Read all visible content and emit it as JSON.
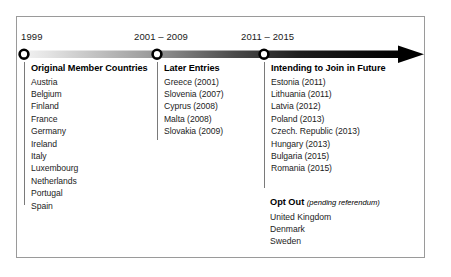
{
  "figure": {
    "kind": "horizontal-timeline",
    "colors": {
      "axis_start": "#e9e9e9",
      "axis_end": "#000000",
      "frame_border": "#9a9a9a",
      "divider": "#7a7a7a",
      "text": "#1c1c1c"
    }
  },
  "timeline": {
    "markers": [
      {
        "label": "1999",
        "x": 24
      },
      {
        "label": "2001 – 2009",
        "x": 157
      },
      {
        "label": "2011 – 2015",
        "x": 264
      }
    ],
    "arrow_label": "arrow-head-right"
  },
  "columns": [
    {
      "heading": "Original Member Countries",
      "entries": [
        "Austria",
        "Belgium",
        "Finland",
        "France",
        "Germany",
        "Ireland",
        "Italy",
        "Luxembourg",
        "Netherlands",
        "Portugal",
        "Spain"
      ]
    },
    {
      "heading": "Later Entries",
      "entries": [
        "Greece (2001)",
        "Slovenia (2007)",
        "Cyprus (2008)",
        "Malta (2008)",
        "Slovakia (2009)"
      ]
    },
    {
      "heading": "Intending to Join in Future",
      "entries": [
        "Estonia (2011)",
        "Lithuania (2011)",
        "Latvia (2012)",
        "Poland (2013)",
        "Czech. Republic (2013)",
        "Hungary (2013)",
        "Bulgaria (2015)",
        "Romania (2015)"
      ]
    }
  ],
  "optout": {
    "title": "Opt Out",
    "note": "(pending referendum)",
    "entries": [
      "United Kingdom",
      "Denmark",
      "Sweden"
    ]
  }
}
